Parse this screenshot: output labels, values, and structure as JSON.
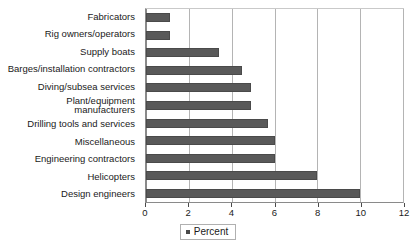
{
  "chart_data": {
    "type": "bar",
    "orientation": "horizontal",
    "title": "",
    "xlabel": "",
    "ylabel": "",
    "xlim": [
      0,
      12
    ],
    "xticks": [
      0,
      2,
      4,
      6,
      8,
      10,
      12
    ],
    "xtick_labels": [
      "0",
      "2",
      "4",
      "6",
      "8",
      "10",
      "12"
    ],
    "grid": true,
    "legend_position": "bottom-center",
    "legend": [
      "Percent"
    ],
    "bar_color": "#595959",
    "categories": [
      "Fabricators",
      "Rig owners/operators",
      "Supply boats",
      "Barges/installation contractors",
      "Diving/subsea services",
      "Plant/equipment\nmanufacturers",
      "Drilling tools and services",
      "Miscellaneous",
      "Engineering contractors",
      "Helicopters",
      "Design engineers"
    ],
    "series": [
      {
        "name": "Percent",
        "values": [
          1.1,
          1.1,
          3.4,
          4.5,
          4.9,
          4.9,
          5.7,
          6.0,
          6.0,
          8.0,
          10.0
        ]
      }
    ]
  },
  "legend": {
    "label": "Percent",
    "marker": "square-marker"
  }
}
